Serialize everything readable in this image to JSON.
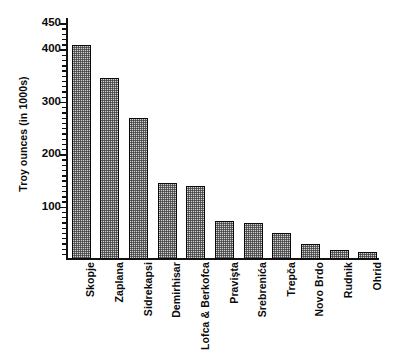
{
  "chart_data": {
    "type": "bar",
    "title": "",
    "xlabel": "",
    "ylabel": "Troy ounces (in 1000s)",
    "ylim": [
      0,
      460
    ],
    "grid": false,
    "legend": false,
    "y_ticks_labeled": [
      100,
      200,
      300,
      400,
      450
    ],
    "y_tick_labels": [
      "100",
      "200",
      "300",
      "400",
      "450"
    ],
    "y_minor_tick_step": 10,
    "categories": [
      "Skopje",
      "Zaplana",
      "Sidrekapsi",
      "Demirhisar",
      "Lofca & Berkofca",
      "Pravişta",
      "Srebrenića",
      "Trepča",
      "Novo Brdo",
      "Rudnik",
      "Ohrid"
    ],
    "values": [
      408,
      345,
      270,
      145,
      139,
      72,
      69,
      50,
      28,
      18,
      14
    ],
    "bar_fill": "#d2d2d2",
    "bar_edge": "#0a0a0a",
    "bar_pattern": "fine-checker-hatch"
  },
  "axis": {
    "y_title": "Troy ounces (in 1000s)"
  }
}
